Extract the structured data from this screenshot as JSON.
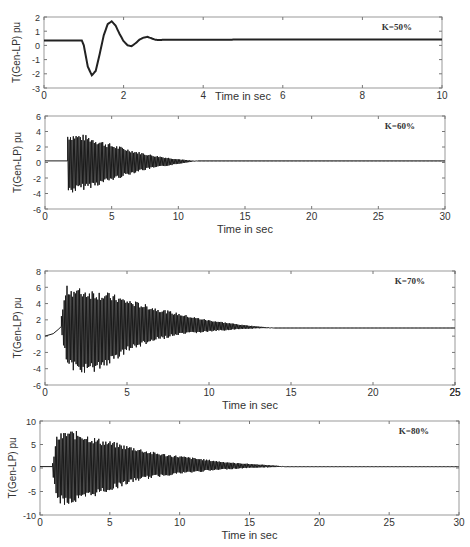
{
  "chart_data": [
    {
      "type": "line",
      "title": "",
      "annotation": "K=50%",
      "xlabel": "Time in sec",
      "ylabel": "T(Gen-LP) pu",
      "xlim": [
        0,
        10
      ],
      "ylim": [
        -3,
        2
      ],
      "xticks": [
        0,
        2,
        4,
        6,
        8,
        10
      ],
      "yticks": [
        -3,
        -2,
        -1,
        0,
        1,
        2
      ],
      "grid": false,
      "box": {
        "left": 44,
        "top": 17,
        "right": 442,
        "bottom": 88
      },
      "series": [
        {
          "name": "T(Gen-LP)",
          "kind": "smooth",
          "x": [
            0,
            0.95,
            1.0,
            1.1,
            1.2,
            1.3,
            1.4,
            1.5,
            1.6,
            1.7,
            1.8,
            1.9,
            2.0,
            2.1,
            2.2,
            2.3,
            2.4,
            2.5,
            2.6,
            2.7,
            2.8,
            2.9,
            3.0,
            10
          ],
          "values": [
            0.35,
            0.35,
            0.0,
            -1.5,
            -2.1,
            -1.8,
            -0.6,
            0.7,
            1.5,
            1.7,
            1.4,
            0.8,
            0.3,
            0.0,
            -0.05,
            0.15,
            0.4,
            0.55,
            0.6,
            0.5,
            0.4,
            0.38,
            0.4,
            0.42
          ]
        }
      ]
    },
    {
      "type": "line",
      "title": "",
      "annotation": "K=60%",
      "xlabel": "Time in sec",
      "ylabel": "T(Gen-LP) pu",
      "xlim": [
        0,
        30
      ],
      "ylim": [
        -6,
        6
      ],
      "xticks": [
        0,
        5,
        10,
        15,
        20,
        25,
        30
      ],
      "yticks": [
        -6,
        -4,
        -2,
        0,
        2,
        4,
        6
      ],
      "grid": false,
      "box": {
        "left": 45,
        "top": 116,
        "right": 445,
        "bottom": 209
      },
      "series": [
        {
          "name": "T(Gen-LP)",
          "kind": "oscillation",
          "baseline": 0.2,
          "onset": 1.7,
          "upper_envelope": {
            "x": [
              1.7,
              2,
              3,
              4,
              5,
              6,
              7,
              8,
              9,
              10,
              11,
              11.5
            ],
            "values": [
              3.8,
              3.8,
              3.6,
              3.0,
              2.4,
              1.9,
              1.4,
              1.0,
              0.7,
              0.45,
              0.25,
              0.2
            ]
          },
          "lower_envelope": {
            "x": [
              1.7,
              2,
              3,
              4,
              5,
              6,
              7,
              8,
              9,
              10,
              11,
              11.5
            ],
            "values": [
              -4.0,
              -4.0,
              -3.5,
              -3.0,
              -2.4,
              -1.8,
              -1.2,
              -0.8,
              -0.5,
              -0.2,
              0.1,
              0.2
            ]
          }
        }
      ]
    },
    {
      "type": "line",
      "title": "",
      "annotation": "K=70%",
      "xlabel": "Time in sec",
      "ylabel": "T(Gen-LP) pu",
      "xlim": [
        0,
        25
      ],
      "ylim": [
        -6,
        8
      ],
      "xticks": [
        0,
        5,
        10,
        15,
        20,
        25,
        25
      ],
      "xtick_labels": [
        "0",
        "5",
        "10",
        "15",
        "20",
        "25",
        "25"
      ],
      "yticks": [
        -6,
        -4,
        -2,
        0,
        2,
        4,
        6,
        8
      ],
      "grid": false,
      "box": {
        "left": 45,
        "top": 271,
        "right": 455,
        "bottom": 385
      },
      "series": [
        {
          "name": "T(Gen-LP)",
          "kind": "oscillation",
          "baseline": 1.0,
          "pre": {
            "x": [
              0,
              0.5,
              0.8,
              1.0
            ],
            "values": [
              0.0,
              0.3,
              0.8,
              1.2
            ]
          },
          "onset": 1.0,
          "upper_envelope": {
            "x": [
              1.0,
              1.3,
              2,
              3,
              4,
              5,
              6,
              7,
              8,
              9,
              10,
              11,
              12,
              13,
              14
            ],
            "values": [
              2.5,
              6.2,
              6.0,
              5.8,
              5.3,
              4.6,
              4.0,
              3.4,
              2.9,
              2.4,
              2.0,
              1.7,
              1.4,
              1.2,
              1.0
            ]
          },
          "lower_envelope": {
            "x": [
              1.0,
              1.3,
              2,
              3,
              4,
              5,
              6,
              7,
              8,
              9,
              10,
              11,
              12,
              13,
              14
            ],
            "values": [
              0.5,
              -3.5,
              -4.7,
              -4.5,
              -3.5,
              -2.0,
              -1.2,
              -0.5,
              0.0,
              0.3,
              0.5,
              0.7,
              0.85,
              0.95,
              1.0
            ]
          }
        }
      ]
    },
    {
      "type": "line",
      "title": "",
      "annotation": "K=80%",
      "xlabel": "Time in sec",
      "ylabel": "T(Gen-LP) pu",
      "xlim": [
        0,
        30
      ],
      "ylim": [
        -10,
        10
      ],
      "xticks": [
        0,
        5,
        10,
        15,
        20,
        25,
        30
      ],
      "yticks": [
        -10,
        -5,
        0,
        5,
        10
      ],
      "grid": false,
      "box": {
        "left": 40,
        "top": 421,
        "right": 459,
        "bottom": 515
      },
      "series": [
        {
          "name": "T(Gen-LP)",
          "kind": "oscillation",
          "baseline": 0.3,
          "onset": 0.9,
          "upper_envelope": {
            "x": [
              0.9,
              1.2,
              2,
              3,
              4,
              5,
              6,
              7,
              8,
              9,
              10,
              11,
              12,
              13,
              14,
              15,
              16,
              17,
              17.5
            ],
            "values": [
              1,
              7.0,
              8.2,
              7.7,
              6.5,
              5.8,
              5.0,
              4.3,
              3.5,
              3.0,
              2.6,
              2.2,
              1.8,
              1.4,
              1.1,
              0.9,
              0.7,
              0.5,
              0.3
            ]
          },
          "lower_envelope": {
            "x": [
              0.9,
              1.2,
              2,
              3,
              4,
              5,
              6,
              7,
              8,
              9,
              10,
              11,
              12,
              13,
              14,
              15,
              16,
              17,
              17.5
            ],
            "values": [
              -1,
              -7.5,
              -8.0,
              -7.3,
              -6.0,
              -5.0,
              -3.8,
              -2.8,
              -2.2,
              -1.7,
              -1.3,
              -1.0,
              -0.7,
              -0.4,
              -0.2,
              0.0,
              0.1,
              0.2,
              0.3
            ]
          }
        }
      ]
    }
  ]
}
